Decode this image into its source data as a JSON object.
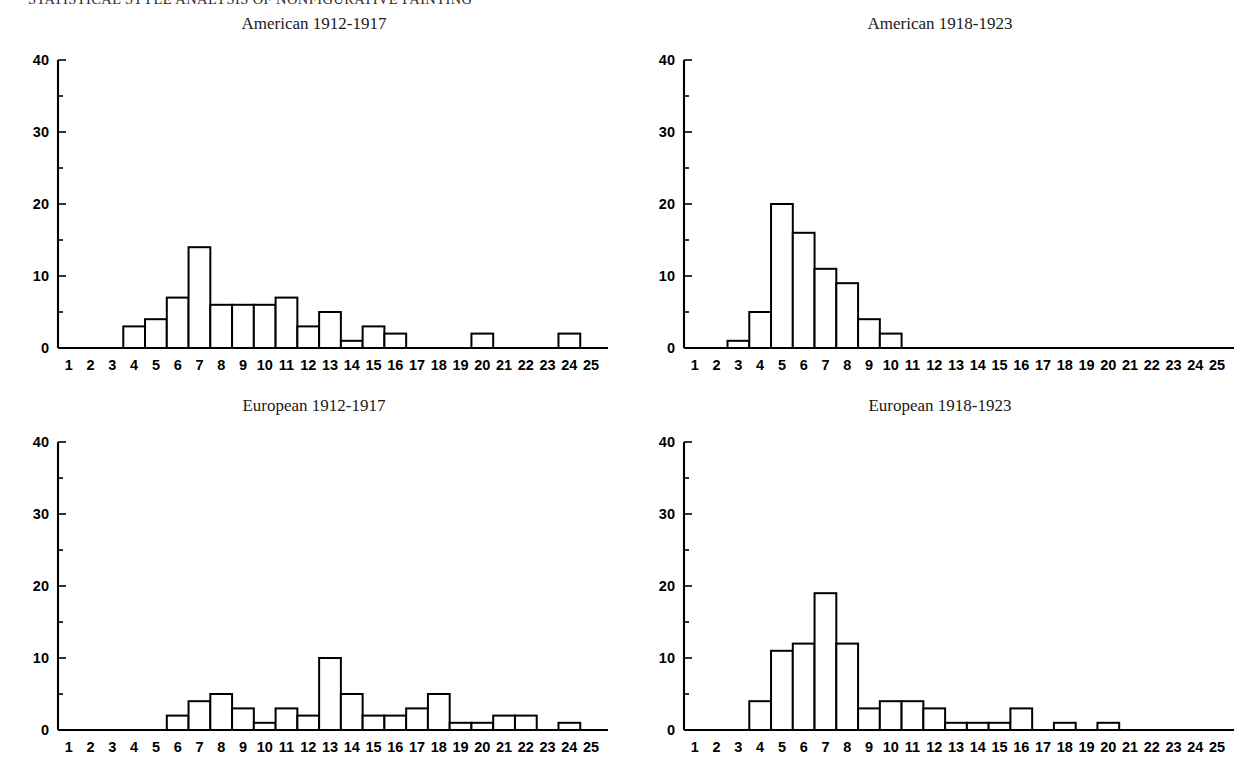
{
  "running_header": "STATISTICAL STYLE ANALYSIS OF NONFIGURATIVE PAINTING",
  "page": {
    "background_color": "#ffffff",
    "ink_color": "#000000"
  },
  "charts": [
    {
      "id": "american-1912-1917",
      "panel_position": "top-left",
      "chart_data": {
        "type": "bar",
        "title": "American 1912-1917",
        "xlabel": "",
        "ylabel": "",
        "xlim": [
          0.5,
          25.5
        ],
        "ylim": [
          0,
          40
        ],
        "yticks": [
          0,
          10,
          20,
          30,
          40
        ],
        "yticks_minor": [
          5,
          15,
          25,
          35
        ],
        "grid": false,
        "legend": false,
        "categories": [
          1,
          2,
          3,
          4,
          5,
          6,
          7,
          8,
          9,
          10,
          11,
          12,
          13,
          14,
          15,
          16,
          17,
          18,
          19,
          20,
          21,
          22,
          23,
          24,
          25
        ],
        "values": [
          0,
          0,
          0,
          3,
          4,
          7,
          14,
          6,
          6,
          6,
          7,
          3,
          5,
          1,
          3,
          2,
          0,
          0,
          0,
          2,
          0,
          0,
          0,
          2,
          0
        ]
      }
    },
    {
      "id": "american-1918-1923",
      "panel_position": "top-right",
      "chart_data": {
        "type": "bar",
        "title": "American 1918-1923",
        "xlabel": "",
        "ylabel": "",
        "xlim": [
          0.5,
          25.5
        ],
        "ylim": [
          0,
          40
        ],
        "yticks": [
          0,
          10,
          20,
          30,
          40
        ],
        "yticks_minor": [
          5,
          15,
          25,
          35
        ],
        "grid": false,
        "legend": false,
        "categories": [
          1,
          2,
          3,
          4,
          5,
          6,
          7,
          8,
          9,
          10,
          11,
          12,
          13,
          14,
          15,
          16,
          17,
          18,
          19,
          20,
          21,
          22,
          23,
          24,
          25
        ],
        "values": [
          0,
          0,
          1,
          5,
          20,
          16,
          11,
          9,
          4,
          2,
          0,
          0,
          0,
          0,
          0,
          0,
          0,
          0,
          0,
          0,
          0,
          0,
          0,
          0,
          0
        ]
      }
    },
    {
      "id": "european-1912-1917",
      "panel_position": "bottom-left",
      "chart_data": {
        "type": "bar",
        "title": "European 1912-1917",
        "xlabel": "",
        "ylabel": "",
        "xlim": [
          0.5,
          25.5
        ],
        "ylim": [
          0,
          40
        ],
        "yticks": [
          0,
          10,
          20,
          30,
          40
        ],
        "yticks_minor": [
          5,
          15,
          25,
          35
        ],
        "grid": false,
        "legend": false,
        "categories": [
          1,
          2,
          3,
          4,
          5,
          6,
          7,
          8,
          9,
          10,
          11,
          12,
          13,
          14,
          15,
          16,
          17,
          18,
          19,
          20,
          21,
          22,
          23,
          24,
          25
        ],
        "values": [
          0,
          0,
          0,
          0,
          0,
          2,
          4,
          5,
          3,
          1,
          3,
          2,
          10,
          5,
          2,
          2,
          3,
          5,
          1,
          1,
          2,
          2,
          0,
          1,
          0
        ]
      }
    },
    {
      "id": "european-1918-1923",
      "panel_position": "bottom-right",
      "chart_data": {
        "type": "bar",
        "title": "European 1918-1923",
        "xlabel": "",
        "ylabel": "",
        "xlim": [
          0.5,
          25.5
        ],
        "ylim": [
          0,
          40
        ],
        "yticks": [
          0,
          10,
          20,
          30,
          40
        ],
        "yticks_minor": [
          5,
          15,
          25,
          35
        ],
        "grid": false,
        "legend": false,
        "categories": [
          1,
          2,
          3,
          4,
          5,
          6,
          7,
          8,
          9,
          10,
          11,
          12,
          13,
          14,
          15,
          16,
          17,
          18,
          19,
          20,
          21,
          22,
          23,
          24,
          25
        ],
        "values": [
          0,
          0,
          0,
          4,
          11,
          12,
          19,
          12,
          3,
          4,
          4,
          3,
          1,
          1,
          1,
          3,
          0,
          1,
          0,
          1,
          0,
          0,
          0,
          0,
          0
        ]
      }
    }
  ]
}
